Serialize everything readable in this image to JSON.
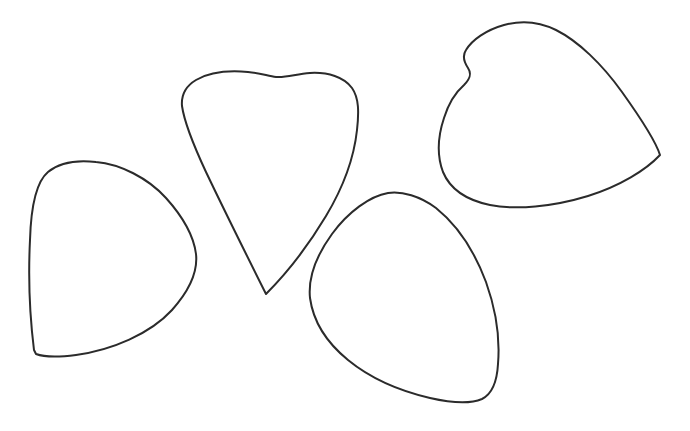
{
  "image": {
    "title": "Four hand-drawn petal outlines",
    "description": "Line drawing of four closed petal / leaf shaped contours arranged in a loose fan on a plain white background",
    "width": 690,
    "height": 431,
    "background_color": "#ffffff",
    "stroke_color": "#2b2b2b",
    "stroke_width": 2,
    "medium": "pen outline drawing",
    "shape_count": 4
  },
  "shapes": [
    {
      "id": "petal-left",
      "name": "left-petal",
      "label": "Left petal",
      "description": "Rounded-triangular petal tilted left, flat broad base at bottom-left, tapering point toward the right",
      "bbox": {
        "x": 28,
        "y": 160,
        "width": 170,
        "height": 200
      },
      "path": "M 34 350 C 30 318 28 280 30 240 C 31 206 36 182 48 172 C 60 162 78 160 96 162 C 120 164 148 178 166 198 C 184 218 194 238 196 254 C 198 272 190 290 172 310 C 150 334 112 350 76 355 C 60 357 44 357 36 354 Z"
    },
    {
      "id": "petal-center",
      "name": "center-petal",
      "label": "Center petal",
      "description": "Tall heart or teardrop shaped petal, broad rounded top with a small dip in the crown, converging to a sharp point at the bottom",
      "bbox": {
        "x": 181,
        "y": 72,
        "width": 178,
        "height": 224
      },
      "path": "M 266 294 C 250 262 226 214 206 172 C 192 142 184 120 182 106 C 181 94 186 86 196 80 C 208 73 226 70 248 72 C 260 73 268 76 276 77 C 286 78 296 74 310 73 C 328 72 344 77 352 88 C 359 98 359 112 357 130 C 354 158 344 186 326 216 C 308 246 286 274 266 294 Z"
    },
    {
      "id": "petal-bottom",
      "name": "bottom-center-petal",
      "label": "Bottom center petal",
      "description": "Rounded-triangular petal pointing up and slightly left, broad rounded bottom-right corner, located below and right of the center petal",
      "bbox": {
        "x": 310,
        "y": 190,
        "width": 190,
        "height": 214
      },
      "path": "M 388 193 C 402 191 420 196 436 208 C 456 224 474 250 486 282 C 496 310 500 340 498 364 C 497 382 492 394 482 399 C 470 404 452 403 430 398 C 400 391 370 378 348 360 C 326 342 313 320 310 298 C 308 278 316 256 332 234 C 348 212 370 196 388 193 Z"
    },
    {
      "id": "petal-top-right",
      "name": "top-right-petal",
      "label": "Top right petal",
      "description": "Large rounded-triangular petal tilted right with a small S-shaped notch on its upper-left edge; broad rounded left side and a tapering corner at the right",
      "bbox": {
        "x": 438,
        "y": 22,
        "width": 224,
        "height": 188
      },
      "path": "M 660 155 C 646 170 620 186 588 196 C 552 207 516 210 490 205 C 466 200 450 189 443 172 C 437 156 438 136 444 118 C 449 102 456 92 464 85 C 470 79 472 74 468 68 C 464 62 462 56 466 50 C 472 40 486 30 504 25 C 522 20 540 22 556 30 C 578 41 602 64 622 92 C 642 120 656 142 660 155 Z"
    }
  ]
}
